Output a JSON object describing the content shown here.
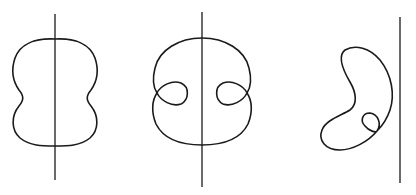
{
  "diagram": {
    "colors": {
      "stroke": "#1a1a1a",
      "background": "#ffffff"
    },
    "figures": [
      {
        "id": "figure-1",
        "shape": "peanut-shaped closed curve symmetric about vertical axis",
        "axis": {
          "x": 55,
          "y1": 14,
          "y2": 180
        }
      },
      {
        "id": "figure-2",
        "shape": "closed curve symmetric about vertical axis with two inward loops",
        "axis": {
          "x": 202,
          "y1": 12,
          "y2": 187
        }
      },
      {
        "id": "figure-3",
        "shape": "kidney-shaped closed curve with one small loop, to the left of a vertical line",
        "axis": {
          "x": 400,
          "y1": 17,
          "y2": 183
        }
      }
    ]
  }
}
